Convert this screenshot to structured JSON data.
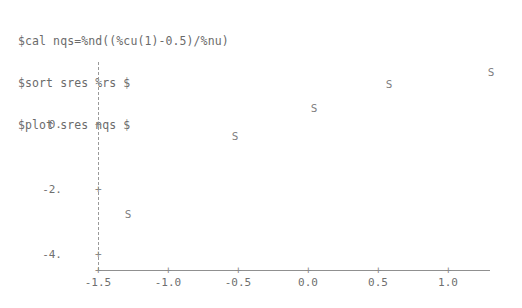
{
  "terminal": {
    "commands": [
      "$cal nqs=%nd((%cu(1)-0.5)/%nu)",
      "$sort sres %rs $",
      "$plot sres nqs $"
    ]
  },
  "chart_data": {
    "type": "scatter",
    "title": "",
    "xlabel": "",
    "ylabel": "",
    "point_marker": "S",
    "xlim": [
      -1.5,
      1.32
    ],
    "ylim": [
      -4.5,
      1.6
    ],
    "grid": false,
    "legend": null,
    "x_ticks": [
      -1.5,
      -1.0,
      -0.5,
      0.0,
      0.5,
      1.0
    ],
    "x_tick_labels": [
      "-1.5",
      "-1.0",
      "-0.5",
      "0.0",
      "0.5",
      "1.0"
    ],
    "y_ticks": [
      0.0,
      -2.0,
      -4.0
    ],
    "y_tick_labels": [
      "0.",
      "-2.",
      "-4."
    ],
    "tick_glyph": "+",
    "points": [
      {
        "label": "S",
        "x": -1.29,
        "y": -2.4
      },
      {
        "label": "S",
        "x": -0.52,
        "y": -0.06
      },
      {
        "label": "S",
        "x": 0.04,
        "y": 0.81
      },
      {
        "label": "S",
        "x": 0.58,
        "y": 1.53
      },
      {
        "label": "S",
        "x": 1.31,
        "y": 1.91
      }
    ],
    "colors": {
      "point": "#7d7d7d",
      "axis": "#909090",
      "text": "#6f6f6f",
      "background": "#ffffff"
    }
  },
  "geometry": {
    "x_axis": {
      "left": 98,
      "top": 270,
      "width": 392
    },
    "y_axis": {
      "left": 98,
      "top": 62,
      "height": 208
    },
    "x_tick_px": [
      98,
      168,
      238,
      308,
      378,
      448
    ],
    "y_tick_px": [
      124,
      189,
      254
    ],
    "point_px": [
      {
        "x": 128,
        "y": 214
      },
      {
        "x": 235,
        "y": 136
      },
      {
        "x": 314,
        "y": 108
      },
      {
        "x": 389,
        "y": 84
      },
      {
        "x": 491,
        "y": 72
      }
    ],
    "x_tick_label_y": 277,
    "y_tick_label_x": 62
  }
}
